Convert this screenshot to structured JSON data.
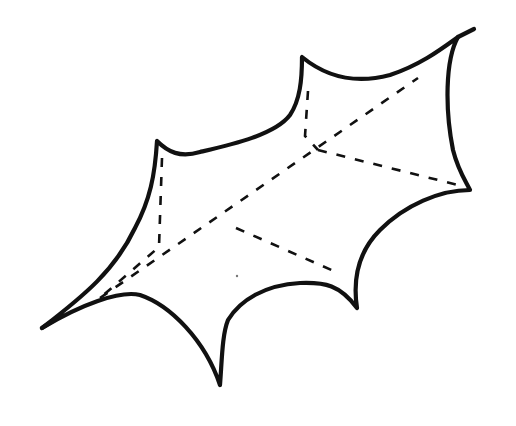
{
  "figure": {
    "width": 516,
    "height": 426,
    "background": "#ffffff",
    "ink_color": "#111111",
    "outline_width": 4.2,
    "vein_width": 2.6,
    "vein_dash": "9 10",
    "outline_path": "M42,328 C80,305 120,290 140,295 C170,305 205,340 220,385 C222,360 222,335 228,320 C240,300 265,285 300,283 C325,282 340,285 357,308 C352,275 360,250 380,230 C405,205 440,190 470,190 C465,180 458,170 453,150 C445,110 445,60 458,37 C440,50 420,65 390,75 C360,83 330,80 302,57 C302,80 300,100 290,115 C275,135 230,145 200,152 C180,158 168,152 157,141 C155,175 150,200 135,228 C115,270 85,295 42,328 Z",
    "top_right_stem": "M458,37 L474,29",
    "left_tip_spur": "M42,328 L56,319",
    "vein_paths": [
      {
        "name": "midrib",
        "d": "M100,298 L418,78"
      },
      {
        "name": "upper-vein-left-notch",
        "d": "M162,158 L159,247 L100,298"
      },
      {
        "name": "upper-vein-top-notch",
        "d": "M308,91 L305,136 L318,150"
      },
      {
        "name": "right-vein",
        "d": "M318,150 L462,186"
      },
      {
        "name": "lower-vein",
        "d": "M236,228 L336,272"
      }
    ],
    "specks": [
      {
        "cx": 237,
        "cy": 276,
        "r": 1.2
      }
    ]
  }
}
